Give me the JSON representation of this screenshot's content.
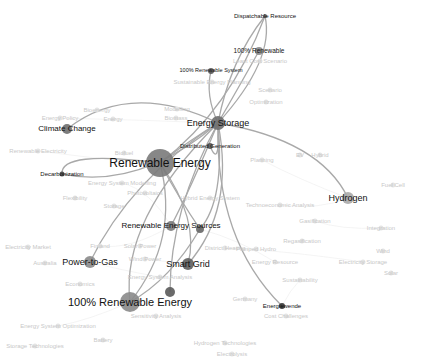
{
  "graph": {
    "title": "Keyword co-occurrence network",
    "focus_node": "Renewable Energy",
    "highlighted_nodes": [
      {
        "id": "renewable-energy",
        "label": "Renewable Energy",
        "x": 160,
        "y": 163,
        "r": 14,
        "fs": 12,
        "color": "#7a7a7a"
      },
      {
        "id": "energy-storage",
        "label": "Energy Storage",
        "x": 218,
        "y": 123,
        "r": 7,
        "fs": 9,
        "color": "#6e6e6e"
      },
      {
        "id": "distributed-generation",
        "label": "Distributed Generation",
        "x": 210,
        "y": 146,
        "r": 3,
        "fs": 6,
        "color": "#555555"
      },
      {
        "id": "dispatchable-resource",
        "label": "Dispatchable Resource",
        "x": 265,
        "y": 16,
        "r": 2,
        "fs": 6,
        "color": "#666666"
      },
      {
        "id": "100-renewable",
        "label": "100% Renewable",
        "x": 259,
        "y": 51,
        "r": 4,
        "fs": 6.5,
        "color": "#888888"
      },
      {
        "id": "100-renewable-system",
        "label": "100% Renewable System",
        "x": 211,
        "y": 71,
        "r": 3,
        "fs": 5.5,
        "color": "#555555"
      },
      {
        "id": "climate-change",
        "label": "Climate Change",
        "x": 67,
        "y": 129,
        "r": 5,
        "fs": 8,
        "color": "#6e6e6e"
      },
      {
        "id": "decarbonization",
        "label": "Decarbonization",
        "x": 62,
        "y": 174,
        "r": 2.5,
        "fs": 6,
        "color": "#444444"
      },
      {
        "id": "hydrogen",
        "label": "Hydrogen",
        "x": 348,
        "y": 198,
        "r": 6,
        "fs": 9,
        "color": "#a8a8a8"
      },
      {
        "id": "renewable-energy-sources",
        "label": "Renewable Energy Sources",
        "x": 171,
        "y": 226,
        "r": 5,
        "fs": 8,
        "color": "#7a7a7a"
      },
      {
        "id": "power-to-gas",
        "label": "Power-to-Gas",
        "x": 90,
        "y": 262,
        "r": 6,
        "fs": 9,
        "color": "#8a8a8a"
      },
      {
        "id": "smart-grid",
        "label": "Smart Grid",
        "x": 188,
        "y": 264,
        "r": 6,
        "fs": 9,
        "color": "#5e5e5e"
      },
      {
        "id": "100-renewable-energy",
        "label": "100% Renewable Energy",
        "x": 130,
        "y": 302,
        "r": 10,
        "fs": 11,
        "color": "#8a8a8a"
      },
      {
        "id": "energiewende",
        "label": "Energiewende",
        "x": 282,
        "y": 306,
        "r": 3,
        "fs": 6,
        "color": "#333333"
      },
      {
        "id": "node-unlabeled-a",
        "label": "",
        "x": 170,
        "y": 292,
        "r": 5,
        "fs": 0,
        "color": "#5a5a5a"
      },
      {
        "id": "node-unlabeled-b",
        "label": "",
        "x": 200,
        "y": 229,
        "r": 4,
        "fs": 0,
        "color": "#666666"
      }
    ],
    "background_nodes": [
      {
        "label": "Sustainable Energy Planning",
        "x": 212,
        "y": 82
      },
      {
        "label": "Least Cost Scenario",
        "x": 260,
        "y": 61
      },
      {
        "label": "Scenario",
        "x": 270,
        "y": 90
      },
      {
        "label": "Optimization",
        "x": 266,
        "y": 102
      },
      {
        "label": "Energy Policy",
        "x": 60,
        "y": 118
      },
      {
        "label": "Energy",
        "x": 113,
        "y": 119
      },
      {
        "label": "Bioenergy",
        "x": 97,
        "y": 110
      },
      {
        "label": "Modelling",
        "x": 177,
        "y": 109
      },
      {
        "label": "Biomass",
        "x": 176,
        "y": 118
      },
      {
        "label": "Renewable Electricity",
        "x": 38,
        "y": 151
      },
      {
        "label": "Biofuel",
        "x": 124,
        "y": 153
      },
      {
        "label": "Planning",
        "x": 262,
        "y": 160
      },
      {
        "label": "EV",
        "x": 300,
        "y": 155
      },
      {
        "label": "Hybrid",
        "x": 320,
        "y": 155
      },
      {
        "label": "Fuel Cell",
        "x": 393,
        "y": 185
      },
      {
        "label": "Energy System Modelling",
        "x": 122,
        "y": 183
      },
      {
        "label": "Photovoltaics",
        "x": 145,
        "y": 193
      },
      {
        "label": "Hybrid Energy System",
        "x": 210,
        "y": 198
      },
      {
        "label": "Flexibility",
        "x": 75,
        "y": 198
      },
      {
        "label": "Storage",
        "x": 114,
        "y": 206
      },
      {
        "label": "Technoeconomic Analysis",
        "x": 280,
        "y": 205
      },
      {
        "label": "Gasification",
        "x": 315,
        "y": 221
      },
      {
        "label": "Integration",
        "x": 381,
        "y": 228
      },
      {
        "label": "District Heating",
        "x": 225,
        "y": 248
      },
      {
        "label": "Pumped Hydro",
        "x": 256,
        "y": 249
      },
      {
        "label": "Regasification",
        "x": 302,
        "y": 241
      },
      {
        "label": "Energy Resource",
        "x": 275,
        "y": 262
      },
      {
        "label": "Electricity Storage",
        "x": 363,
        "y": 262
      },
      {
        "label": "Wind",
        "x": 383,
        "y": 251
      },
      {
        "label": "Solar",
        "x": 391,
        "y": 273
      },
      {
        "label": "Electricity Market",
        "x": 28,
        "y": 247
      },
      {
        "label": "Finland",
        "x": 100,
        "y": 246
      },
      {
        "label": "Solar Power",
        "x": 140,
        "y": 246
      },
      {
        "label": "Wind Power",
        "x": 145,
        "y": 259
      },
      {
        "label": "Australia",
        "x": 45,
        "y": 263
      },
      {
        "label": "Energy System Analysis",
        "x": 160,
        "y": 277
      },
      {
        "label": "Economics",
        "x": 80,
        "y": 284
      },
      {
        "label": "Sustainability",
        "x": 300,
        "y": 280
      },
      {
        "label": "Germany",
        "x": 245,
        "y": 299
      },
      {
        "label": "Cost Challenges",
        "x": 286,
        "y": 316
      },
      {
        "label": "Sensitivity Analysis",
        "x": 156,
        "y": 316
      },
      {
        "label": "Energy System Optimization",
        "x": 58,
        "y": 326
      },
      {
        "label": "Battery",
        "x": 103,
        "y": 340
      },
      {
        "label": "Storage Technologies",
        "x": 35,
        "y": 346
      },
      {
        "label": "Hydrogen Technologies",
        "x": 225,
        "y": 343
      },
      {
        "label": "Electrolysis",
        "x": 232,
        "y": 354
      }
    ],
    "edge_color": "#9a9a9a"
  }
}
